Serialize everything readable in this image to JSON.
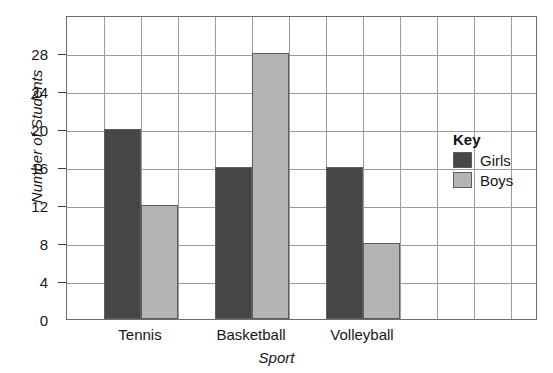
{
  "chart_data": {
    "type": "bar",
    "title": "",
    "xlabel": "Sport",
    "ylabel": "Number of Students",
    "categories": [
      "Tennis",
      "Basketball",
      "Volleyball"
    ],
    "series": [
      {
        "name": "Girls",
        "color": "#464646",
        "values": [
          20,
          16,
          16
        ]
      },
      {
        "name": "Boys",
        "color": "#b4b4b4",
        "values": [
          12,
          28,
          8
        ]
      }
    ],
    "ylim": [
      0,
      32
    ],
    "ytick_labels": [
      "0",
      "4",
      "8",
      "12",
      "16",
      "20",
      "24",
      "28"
    ],
    "ytick_values": [
      0,
      4,
      8,
      12,
      16,
      20,
      24,
      28
    ],
    "grid": true,
    "legend_position": "right-inside",
    "legend_title": "Key"
  },
  "legend": {
    "title": "Key",
    "entries": [
      {
        "label": "Girls",
        "color": "#464646"
      },
      {
        "label": "Boys",
        "color": "#b4b4b4"
      }
    ]
  },
  "axes": {
    "y_label": "Number of Students",
    "x_label": "Sport"
  },
  "colors": {
    "girls": "#464646",
    "boys": "#b4b4b4",
    "grid": "#9a9a9a",
    "frame": "#6c6c6c",
    "text": "#171717"
  }
}
